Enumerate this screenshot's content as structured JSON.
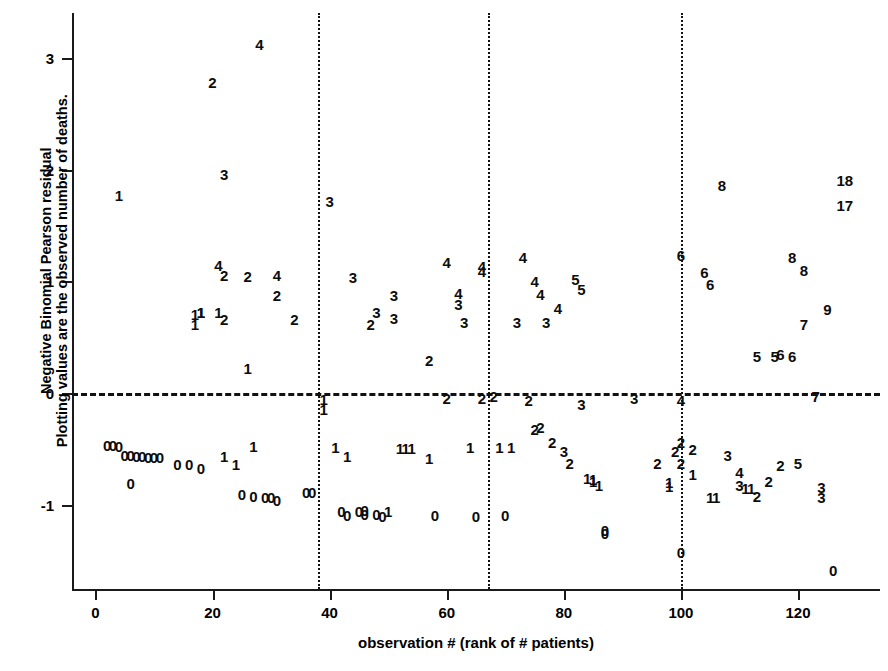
{
  "chart_data": {
    "type": "scatter",
    "title": "",
    "xlabel": "observation # (rank of # patients)",
    "ylabel_line1": "Negative Binomial Pearson residual",
    "ylabel_line2": "Plotting values are the observed number of deaths.",
    "xlim": [
      -4,
      134
    ],
    "ylim": [
      -1.75,
      3.4
    ],
    "xticks": [
      0,
      20,
      40,
      60,
      80,
      100,
      120
    ],
    "yticks": [
      -1,
      0,
      1,
      2,
      3
    ],
    "xtick_labels": [
      "0",
      "20",
      "40",
      "60",
      "80",
      "100",
      "120"
    ],
    "ytick_labels": [
      "-1",
      "0",
      "1",
      "2",
      "3"
    ],
    "grid": false,
    "legend": null,
    "reference_lines": {
      "horizontal": [
        {
          "y": 0,
          "style": "dashed"
        }
      ],
      "vertical": [
        {
          "x": 38,
          "style": "dotted"
        },
        {
          "x": 67,
          "style": "dotted"
        },
        {
          "x": 100,
          "style": "dotted"
        }
      ]
    },
    "marker_encoding": "text label = observed number of deaths",
    "points": [
      {
        "x": 2,
        "y": -0.46,
        "label": "0"
      },
      {
        "x": 3,
        "y": -0.46,
        "label": "0"
      },
      {
        "x": 4,
        "y": -0.47,
        "label": "0"
      },
      {
        "x": 5,
        "y": -0.55,
        "label": "0"
      },
      {
        "x": 6,
        "y": -0.55,
        "label": "0"
      },
      {
        "x": 6,
        "y": -0.8,
        "label": "0"
      },
      {
        "x": 7,
        "y": -0.56,
        "label": "0"
      },
      {
        "x": 8,
        "y": -0.56,
        "label": "0"
      },
      {
        "x": 9,
        "y": -0.57,
        "label": "0"
      },
      {
        "x": 10,
        "y": -0.57,
        "label": "0"
      },
      {
        "x": 11,
        "y": -0.57,
        "label": "0"
      },
      {
        "x": 4,
        "y": 1.77,
        "label": "1"
      },
      {
        "x": 14,
        "y": -0.63,
        "label": "0"
      },
      {
        "x": 16,
        "y": -0.63,
        "label": "0"
      },
      {
        "x": 17,
        "y": 0.71,
        "label": "1"
      },
      {
        "x": 17,
        "y": 0.62,
        "label": "1"
      },
      {
        "x": 18,
        "y": 0.73,
        "label": "1"
      },
      {
        "x": 18,
        "y": 0.73,
        "label": "1"
      },
      {
        "x": 18,
        "y": -0.67,
        "label": "0"
      },
      {
        "x": 20,
        "y": 2.78,
        "label": "2"
      },
      {
        "x": 21,
        "y": 0.73,
        "label": "1"
      },
      {
        "x": 21,
        "y": 1.15,
        "label": "4"
      },
      {
        "x": 22,
        "y": 1.06,
        "label": "2"
      },
      {
        "x": 22,
        "y": 1.96,
        "label": "3"
      },
      {
        "x": 22,
        "y": 0.66,
        "label": "2"
      },
      {
        "x": 22,
        "y": -0.56,
        "label": "1"
      },
      {
        "x": 24,
        "y": -0.63,
        "label": "1"
      },
      {
        "x": 25,
        "y": -0.9,
        "label": "0"
      },
      {
        "x": 26,
        "y": 1.05,
        "label": "2"
      },
      {
        "x": 26,
        "y": 0.23,
        "label": "1"
      },
      {
        "x": 27,
        "y": -0.47,
        "label": "1"
      },
      {
        "x": 27,
        "y": -0.92,
        "label": "0"
      },
      {
        "x": 28,
        "y": 3.12,
        "label": "4"
      },
      {
        "x": 29,
        "y": -0.93,
        "label": "0"
      },
      {
        "x": 30,
        "y": -0.93,
        "label": "0"
      },
      {
        "x": 31,
        "y": 1.06,
        "label": "4"
      },
      {
        "x": 31,
        "y": 0.88,
        "label": "2"
      },
      {
        "x": 31,
        "y": -0.95,
        "label": "0"
      },
      {
        "x": 34,
        "y": 0.66,
        "label": "2"
      },
      {
        "x": 36,
        "y": -0.88,
        "label": "0"
      },
      {
        "x": 37,
        "y": -0.88,
        "label": "0"
      },
      {
        "x": 39,
        "y": -0.05,
        "label": "1"
      },
      {
        "x": 39,
        "y": -0.14,
        "label": "1"
      },
      {
        "x": 40,
        "y": 1.72,
        "label": "3"
      },
      {
        "x": 41,
        "y": -0.48,
        "label": "1"
      },
      {
        "x": 42,
        "y": -1.05,
        "label": "0"
      },
      {
        "x": 43,
        "y": -1.09,
        "label": "0"
      },
      {
        "x": 43,
        "y": -0.56,
        "label": "1"
      },
      {
        "x": 44,
        "y": 1.04,
        "label": "3"
      },
      {
        "x": 45,
        "y": -1.05,
        "label": "0"
      },
      {
        "x": 46,
        "y": -1.08,
        "label": "0"
      },
      {
        "x": 46,
        "y": -1.04,
        "label": "0"
      },
      {
        "x": 47,
        "y": 0.62,
        "label": "2"
      },
      {
        "x": 48,
        "y": 0.73,
        "label": "3"
      },
      {
        "x": 48,
        "y": -1.08,
        "label": "0"
      },
      {
        "x": 49,
        "y": -1.1,
        "label": "0"
      },
      {
        "x": 50,
        "y": -1.05,
        "label": "1"
      },
      {
        "x": 51,
        "y": 0.88,
        "label": "3"
      },
      {
        "x": 51,
        "y": 0.67,
        "label": "3"
      },
      {
        "x": 52,
        "y": -0.49,
        "label": "1"
      },
      {
        "x": 53,
        "y": -0.49,
        "label": "1"
      },
      {
        "x": 54,
        "y": -0.49,
        "label": "1"
      },
      {
        "x": 57,
        "y": 0.3,
        "label": "2"
      },
      {
        "x": 57,
        "y": -0.58,
        "label": "1"
      },
      {
        "x": 58,
        "y": -1.09,
        "label": "0"
      },
      {
        "x": 60,
        "y": 1.17,
        "label": "4"
      },
      {
        "x": 60,
        "y": -0.04,
        "label": "2"
      },
      {
        "x": 62,
        "y": 0.8,
        "label": "3"
      },
      {
        "x": 62,
        "y": 0.9,
        "label": "4"
      },
      {
        "x": 63,
        "y": 0.64,
        "label": "3"
      },
      {
        "x": 64,
        "y": -0.48,
        "label": "1"
      },
      {
        "x": 65,
        "y": -1.1,
        "label": "0"
      },
      {
        "x": 66,
        "y": -0.04,
        "label": "2"
      },
      {
        "x": 66,
        "y": 1.09,
        "label": "4"
      },
      {
        "x": 66,
        "y": 1.14,
        "label": "4"
      },
      {
        "x": 68,
        "y": -0.02,
        "label": "2"
      },
      {
        "x": 69,
        "y": -0.48,
        "label": "1"
      },
      {
        "x": 70,
        "y": -1.09,
        "label": "0"
      },
      {
        "x": 71,
        "y": -0.48,
        "label": "1"
      },
      {
        "x": 72,
        "y": 0.64,
        "label": "3"
      },
      {
        "x": 73,
        "y": 1.22,
        "label": "4"
      },
      {
        "x": 74,
        "y": -0.06,
        "label": "2"
      },
      {
        "x": 75,
        "y": -0.32,
        "label": "2"
      },
      {
        "x": 75,
        "y": 1.0,
        "label": "4"
      },
      {
        "x": 76,
        "y": 0.89,
        "label": "4"
      },
      {
        "x": 76,
        "y": -0.3,
        "label": "2"
      },
      {
        "x": 77,
        "y": 0.64,
        "label": "3"
      },
      {
        "x": 78,
        "y": -0.44,
        "label": "2"
      },
      {
        "x": 79,
        "y": 0.76,
        "label": "4"
      },
      {
        "x": 80,
        "y": -0.52,
        "label": "3"
      },
      {
        "x": 81,
        "y": -0.62,
        "label": "2"
      },
      {
        "x": 82,
        "y": 1.02,
        "label": "5"
      },
      {
        "x": 83,
        "y": 0.93,
        "label": "5"
      },
      {
        "x": 83,
        "y": -0.1,
        "label": "3"
      },
      {
        "x": 84,
        "y": -0.76,
        "label": "1"
      },
      {
        "x": 85,
        "y": -0.78,
        "label": "1"
      },
      {
        "x": 85,
        "y": -0.77,
        "label": "1"
      },
      {
        "x": 86,
        "y": -0.82,
        "label": "1"
      },
      {
        "x": 87,
        "y": -1.22,
        "label": "0"
      },
      {
        "x": 87,
        "y": -1.25,
        "label": "0"
      },
      {
        "x": 92,
        "y": -0.04,
        "label": "3"
      },
      {
        "x": 96,
        "y": -0.62,
        "label": "2"
      },
      {
        "x": 98,
        "y": -0.79,
        "label": "1"
      },
      {
        "x": 98,
        "y": -0.83,
        "label": "1"
      },
      {
        "x": 99,
        "y": -0.52,
        "label": "2"
      },
      {
        "x": 100,
        "y": 1.24,
        "label": "6"
      },
      {
        "x": 100,
        "y": -0.06,
        "label": "4"
      },
      {
        "x": 100,
        "y": -0.62,
        "label": "2"
      },
      {
        "x": 100,
        "y": -0.44,
        "label": "2"
      },
      {
        "x": 100,
        "y": -1.42,
        "label": "0"
      },
      {
        "x": 102,
        "y": -0.5,
        "label": "2"
      },
      {
        "x": 102,
        "y": -0.72,
        "label": "1"
      },
      {
        "x": 104,
        "y": 1.08,
        "label": "6"
      },
      {
        "x": 105,
        "y": 0.98,
        "label": "6"
      },
      {
        "x": 105,
        "y": -0.93,
        "label": "1"
      },
      {
        "x": 106,
        "y": -0.93,
        "label": "1"
      },
      {
        "x": 107,
        "y": 1.86,
        "label": "8"
      },
      {
        "x": 108,
        "y": -0.55,
        "label": "3"
      },
      {
        "x": 110,
        "y": -0.7,
        "label": "4"
      },
      {
        "x": 110,
        "y": -0.82,
        "label": "3"
      },
      {
        "x": 111,
        "y": -0.85,
        "label": "1"
      },
      {
        "x": 112,
        "y": -0.85,
        "label": "1"
      },
      {
        "x": 113,
        "y": 0.33,
        "label": "5"
      },
      {
        "x": 113,
        "y": -0.92,
        "label": "2"
      },
      {
        "x": 115,
        "y": -0.78,
        "label": "2"
      },
      {
        "x": 116,
        "y": 0.33,
        "label": "5"
      },
      {
        "x": 117,
        "y": 0.35,
        "label": "6"
      },
      {
        "x": 117,
        "y": -0.64,
        "label": "2"
      },
      {
        "x": 119,
        "y": 1.22,
        "label": "8"
      },
      {
        "x": 119,
        "y": 0.33,
        "label": "6"
      },
      {
        "x": 120,
        "y": -0.62,
        "label": "5"
      },
      {
        "x": 121,
        "y": 1.1,
        "label": "8"
      },
      {
        "x": 121,
        "y": 0.62,
        "label": "7"
      },
      {
        "x": 123,
        "y": -0.02,
        "label": "7"
      },
      {
        "x": 124,
        "y": -0.84,
        "label": "3"
      },
      {
        "x": 124,
        "y": -0.93,
        "label": "3"
      },
      {
        "x": 125,
        "y": 0.75,
        "label": "9"
      },
      {
        "x": 126,
        "y": -1.58,
        "label": "0"
      },
      {
        "x": 128,
        "y": 1.91,
        "label": "18"
      },
      {
        "x": 128,
        "y": 1.68,
        "label": "17"
      }
    ]
  }
}
